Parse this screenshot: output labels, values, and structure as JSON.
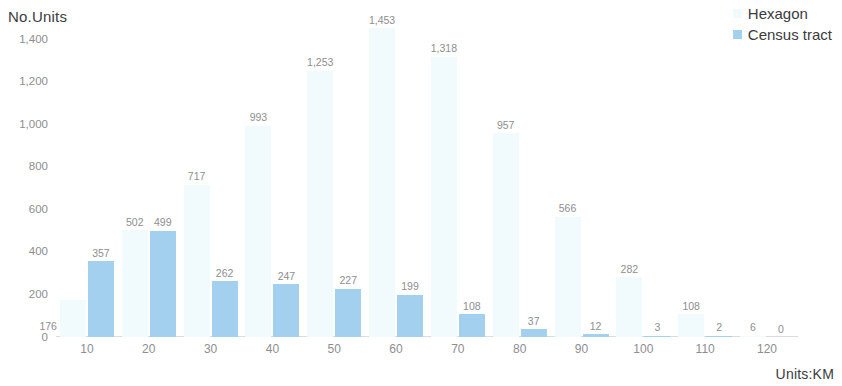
{
  "chart_data": {
    "type": "bar",
    "title": "",
    "ylabel": "No.Units",
    "xlabel": "Units:KM",
    "categories": [
      "10",
      "20",
      "30",
      "40",
      "50",
      "60",
      "70",
      "80",
      "90",
      "100",
      "110",
      "120"
    ],
    "yticks": [
      "0",
      "200",
      "400",
      "600",
      "800",
      "1,000",
      "1,200",
      "1,400"
    ],
    "ytick_values": [
      0,
      200,
      400,
      600,
      800,
      1000,
      1200,
      1400
    ],
    "ylim": [
      0,
      1500
    ],
    "grid": false,
    "legend_position": "top-right",
    "series": [
      {
        "name": "Hexagon",
        "color": "#f1fafc",
        "values": [
          176,
          502,
          717,
          993,
          1253,
          1453,
          1318,
          957,
          566,
          282,
          108,
          6
        ],
        "labels": [
          "176",
          "502",
          "717",
          "993",
          "1,253",
          "1,453",
          "1,318",
          "957",
          "566",
          "282",
          "108",
          "6"
        ]
      },
      {
        "name": "Census tract",
        "color": "#a3d0ee",
        "values": [
          357,
          499,
          262,
          247,
          227,
          199,
          108,
          37,
          12,
          3,
          2,
          0
        ],
        "labels": [
          "357",
          "499",
          "262",
          "247",
          "227",
          "199",
          "108",
          "37",
          "12",
          "3",
          "2",
          "0"
        ]
      }
    ]
  },
  "legend": {
    "items": [
      {
        "label": "Hexagon",
        "color": "#f1fafc"
      },
      {
        "label": "Census tract",
        "color": "#a3d0ee"
      }
    ]
  }
}
